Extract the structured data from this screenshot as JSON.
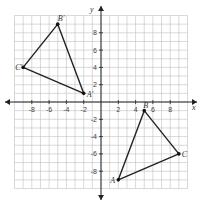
{
  "plane": {
    "x_label": "x",
    "y_label": "y",
    "range": {
      "xmin": -10,
      "xmax": 10,
      "ymin": -10,
      "ymax": 10
    },
    "x_ticks": [
      {
        "v": -8,
        "label": "-8"
      },
      {
        "v": -6,
        "label": "-6"
      },
      {
        "v": -4,
        "label": "-4"
      },
      {
        "v": -2,
        "label": "-2"
      },
      {
        "v": 2,
        "label": "2"
      },
      {
        "v": 4,
        "label": "4"
      },
      {
        "v": 6,
        "label": "6"
      },
      {
        "v": 8,
        "label": "8"
      }
    ],
    "y_ticks": [
      {
        "v": 8,
        "label": "8"
      },
      {
        "v": 6,
        "label": "6"
      },
      {
        "v": 4,
        "label": "4"
      },
      {
        "v": 2,
        "label": "2"
      },
      {
        "v": -2,
        "label": "-2"
      },
      {
        "v": -4,
        "label": "-4"
      },
      {
        "v": -6,
        "label": "-6"
      },
      {
        "v": -8,
        "label": "-8"
      }
    ]
  },
  "triangles": [
    {
      "name": "image",
      "vertices": [
        {
          "label": "A′",
          "x": -2,
          "y": 1,
          "dx": 3,
          "dy": 4
        },
        {
          "label": "B′",
          "x": -5,
          "y": 9,
          "dx": 0,
          "dy": -3
        },
        {
          "label": "C′",
          "x": -9,
          "y": 4,
          "dx": -8,
          "dy": 3
        }
      ]
    },
    {
      "name": "preimage",
      "vertices": [
        {
          "label": "A",
          "x": 2,
          "y": -9,
          "dx": -8,
          "dy": 3
        },
        {
          "label": "B",
          "x": 5,
          "y": -1,
          "dx": -1,
          "dy": -3
        },
        {
          "label": "C",
          "x": 9,
          "y": -6,
          "dx": 3,
          "dy": 3
        }
      ]
    }
  ]
}
